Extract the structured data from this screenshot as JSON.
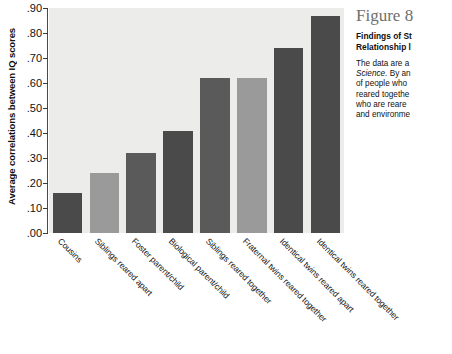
{
  "chart_data": {
    "type": "bar",
    "title": "",
    "xlabel": "",
    "ylabel": "Average correlations between IQ scores",
    "ylim": [
      0.0,
      0.9
    ],
    "ytick_labels": [
      ".90",
      ".80",
      ".70",
      ".60",
      ".50",
      ".40",
      ".30",
      ".20",
      ".10",
      ".00"
    ],
    "ytick_values": [
      0.9,
      0.8,
      0.7,
      0.6,
      0.5,
      0.4,
      0.3,
      0.2,
      0.1,
      0.0
    ],
    "grid": false,
    "legend": "none",
    "plot_background": "#ececea",
    "categories": [
      "Cousins",
      "Siblings reared apart",
      "Foster parent/child",
      "Biological parent/child",
      "Siblings reared together",
      "Fraternal twins reared together",
      "Identical twins reared apart",
      "Identical twins reared together"
    ],
    "values": [
      0.16,
      0.24,
      0.32,
      0.41,
      0.62,
      0.62,
      0.74,
      0.87
    ],
    "bar_colors": [
      "#4a4a4a",
      "#9a9a9a",
      "#5a5a5a",
      "#4a4a4a",
      "#5a5a5a",
      "#9a9a9a",
      "#4a4a4a",
      "#4a4a4a"
    ]
  },
  "caption": {
    "figure_number": "Figure 8",
    "heading_line_1": "Findings of St",
    "heading_line_2": "Relationship l",
    "body_lines": [
      "The data are a",
      "Science. By an",
      "of people who",
      "reared togethe",
      "who are reare",
      "and environme"
    ],
    "italic_word": "Science."
  }
}
